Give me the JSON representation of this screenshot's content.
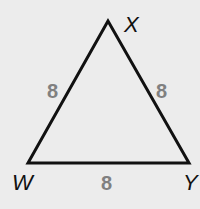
{
  "diagram": {
    "type": "triangle",
    "stroke_color": "#111111",
    "background_color": "#ececec",
    "label_color": "#808080",
    "vertices": {
      "X": {
        "label": "X",
        "x": 108,
        "y": 21
      },
      "W": {
        "label": "W",
        "x": 28,
        "y": 163
      },
      "Y": {
        "label": "Y",
        "x": 189,
        "y": 163
      }
    },
    "sides": {
      "WX": {
        "label": "8"
      },
      "XY": {
        "label": "8"
      },
      "WY": {
        "label": "8"
      }
    }
  }
}
